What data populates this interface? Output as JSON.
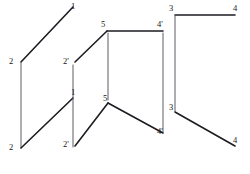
{
  "figure": {
    "background_color": "#ffffff",
    "line_color": "#1c1c22",
    "thin_line_color": "#4a4a52",
    "label_color": "#15151a",
    "width": 250,
    "height": 174
  },
  "labels": [
    {
      "id": "label-1-top",
      "text": "1",
      "x": 71,
      "y": 2
    },
    {
      "id": "label-2-upper",
      "text": "2",
      "x": 9,
      "y": 57
    },
    {
      "id": "label-2-lower",
      "text": "2",
      "x": 9,
      "y": 143
    },
    {
      "id": "label-1-middle",
      "text": "1",
      "x": 71,
      "y": 88
    },
    {
      "id": "label-2p-upper",
      "text": "2'",
      "x": 63,
      "y": 57
    },
    {
      "id": "label-2p-lower",
      "text": "2'",
      "x": 63,
      "y": 140
    },
    {
      "id": "label-5-upper",
      "text": "5",
      "x": 101,
      "y": 20
    },
    {
      "id": "label-5-lower",
      "text": "5",
      "x": 103,
      "y": 94
    },
    {
      "id": "label-4p-upper",
      "text": "4'",
      "x": 157,
      "y": 20
    },
    {
      "id": "label-4p-lower",
      "text": "4'",
      "x": 157,
      "y": 127
    },
    {
      "id": "label-3-upper",
      "text": "3",
      "x": 169,
      "y": 4
    },
    {
      "id": "label-3-lower",
      "text": "3",
      "x": 169,
      "y": 103
    },
    {
      "id": "label-4-upper",
      "text": "4",
      "x": 233,
      "y": 4
    },
    {
      "id": "label-4-lower",
      "text": "4",
      "x": 233,
      "y": 136
    }
  ],
  "segments": [
    {
      "id": "seg-2-to-1-upper",
      "x1": 21,
      "y1": 62,
      "x2": 73,
      "y2": 7,
      "weight": "thick"
    },
    {
      "id": "seg-2-vertical-left",
      "x1": 21,
      "y1": 63,
      "x2": 21,
      "y2": 148,
      "weight": "thin"
    },
    {
      "id": "seg-2-to-1-lower",
      "x1": 21,
      "y1": 148,
      "x2": 73,
      "y2": 98,
      "weight": "thick"
    },
    {
      "id": "seg-2p-vertical",
      "x1": 73,
      "y1": 65,
      "x2": 73,
      "y2": 147,
      "weight": "thin"
    },
    {
      "id": "seg-2p-to-5-upper",
      "x1": 75,
      "y1": 62,
      "x2": 107,
      "y2": 31,
      "weight": "thick"
    },
    {
      "id": "seg-5-to-4p-upper",
      "x1": 107,
      "y1": 31,
      "x2": 163,
      "y2": 31,
      "weight": "thick"
    },
    {
      "id": "seg-5-vertical",
      "x1": 108,
      "y1": 33,
      "x2": 108,
      "y2": 100,
      "weight": "thin"
    },
    {
      "id": "seg-4p-vertical",
      "x1": 163,
      "y1": 33,
      "x2": 163,
      "y2": 132,
      "weight": "thin"
    },
    {
      "id": "seg-2p-to-5-lower",
      "x1": 75,
      "y1": 146,
      "x2": 108,
      "y2": 103,
      "weight": "thick"
    },
    {
      "id": "seg-5-to-4p-lower",
      "x1": 108,
      "y1": 103,
      "x2": 163,
      "y2": 133,
      "weight": "thick"
    },
    {
      "id": "seg-3-to-4-upper",
      "x1": 175,
      "y1": 15,
      "x2": 235,
      "y2": 15,
      "weight": "thick"
    },
    {
      "id": "seg-3-vertical",
      "x1": 175,
      "y1": 16,
      "x2": 175,
      "y2": 111,
      "weight": "thin"
    },
    {
      "id": "seg-3-to-4-lower",
      "x1": 175,
      "y1": 112,
      "x2": 235,
      "y2": 146,
      "weight": "thick"
    }
  ]
}
